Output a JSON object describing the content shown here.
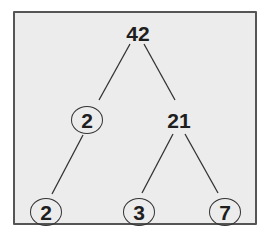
{
  "diagram": {
    "type": "factor-tree",
    "root": "42",
    "nodes": [
      {
        "id": "n42",
        "value": "42",
        "circled": false,
        "x": 138,
        "y": 33
      },
      {
        "id": "n2a",
        "value": "2",
        "circled": true,
        "x": 87,
        "y": 120
      },
      {
        "id": "n21",
        "value": "21",
        "circled": false,
        "x": 179,
        "y": 120
      },
      {
        "id": "n2b",
        "value": "2",
        "circled": true,
        "x": 46,
        "y": 212
      },
      {
        "id": "n3",
        "value": "3",
        "circled": true,
        "x": 139,
        "y": 212
      },
      {
        "id": "n7",
        "value": "7",
        "circled": true,
        "x": 225,
        "y": 212
      }
    ],
    "edges": [
      [
        "42",
        "2"
      ],
      [
        "42",
        "21"
      ],
      [
        "2",
        "2"
      ],
      [
        "21",
        "3"
      ],
      [
        "21",
        "7"
      ]
    ]
  },
  "colors": {
    "background": "#ececec",
    "border": "#555555",
    "text": "#1e1e1e"
  }
}
